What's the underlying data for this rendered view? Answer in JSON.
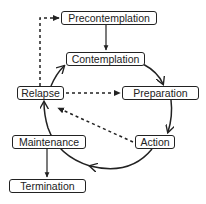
{
  "diagram": {
    "nodes": [
      {
        "id": "precontemplation",
        "label": "Precontemplation"
      },
      {
        "id": "contemplation",
        "label": "Contemplation"
      },
      {
        "id": "relapse",
        "label": "Relapse"
      },
      {
        "id": "preparation",
        "label": "Preparation"
      },
      {
        "id": "maintenance",
        "label": "Maintenance"
      },
      {
        "id": "action",
        "label": "Action"
      },
      {
        "id": "termination",
        "label": "Termination"
      }
    ],
    "edges": [
      {
        "from": "precontemplation",
        "to": "contemplation",
        "style": "solid"
      },
      {
        "from": "contemplation",
        "to": "preparation",
        "style": "solid-curved"
      },
      {
        "from": "preparation",
        "to": "action",
        "style": "solid-curved"
      },
      {
        "from": "action",
        "to": "maintenance",
        "style": "solid-curved"
      },
      {
        "from": "maintenance",
        "to": "relapse",
        "style": "solid-curved"
      },
      {
        "from": "relapse",
        "to": "contemplation",
        "style": "solid-curved"
      },
      {
        "from": "maintenance",
        "to": "termination",
        "style": "solid"
      },
      {
        "from": "relapse",
        "to": "precontemplation",
        "style": "dashed"
      },
      {
        "from": "relapse",
        "to": "preparation",
        "style": "dashed"
      },
      {
        "from": "action",
        "to": "relapse",
        "style": "dashed"
      }
    ],
    "colors": {
      "line": "#222222",
      "background": "#ffffff"
    }
  }
}
